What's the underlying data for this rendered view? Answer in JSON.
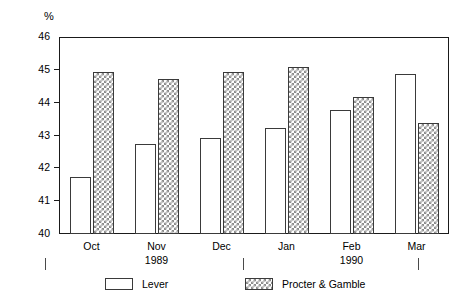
{
  "chart_data": {
    "type": "bar",
    "title": "",
    "subtitle": "",
    "xlabel": "",
    "ylabel": "%",
    "unit_label": "%",
    "categories": [
      "Oct",
      "Nov",
      "Dec",
      "Jan",
      "Feb",
      "Mar"
    ],
    "category_years": [
      "",
      "1989",
      "",
      "",
      "1990",
      ""
    ],
    "series": [
      {
        "name": "Lever",
        "fill": "white",
        "values": [
          41.7,
          42.7,
          42.9,
          43.2,
          43.75,
          44.85
        ]
      },
      {
        "name": "Procter & Gamble",
        "fill": "checkered",
        "values": [
          44.9,
          44.7,
          44.9,
          45.05,
          44.15,
          43.35
        ]
      }
    ],
    "ylim": [
      40,
      46
    ],
    "yticks": [
      46,
      45,
      44,
      43,
      42,
      41,
      40
    ],
    "ytick_labels": [
      "46",
      "45",
      "44",
      "43",
      "42",
      "41",
      "40"
    ],
    "grid": false,
    "legend_position": "bottom",
    "colors": {
      "axis": "#1a1a1a",
      "bar_outline": "#3a3a3a",
      "lever_fill": "#ffffff",
      "pg_pattern": "#8c8c8c",
      "background": "#ffffff"
    }
  },
  "legend": {
    "entries": [
      {
        "label": "Lever"
      },
      {
        "label": "Procter & Gamble"
      }
    ]
  },
  "separators": {
    "count": 3
  }
}
